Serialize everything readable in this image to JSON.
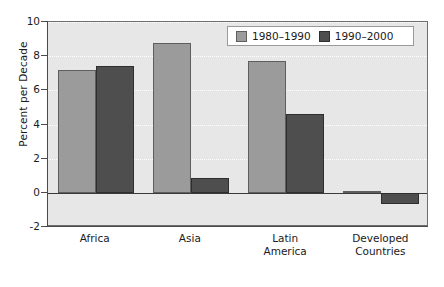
{
  "chart_data": {
    "type": "bar",
    "title": "",
    "xlabel": "",
    "ylabel": "Percent per Decade",
    "ylim": [
      -2,
      10
    ],
    "yticks": [
      -2,
      0,
      2,
      4,
      6,
      8,
      10
    ],
    "ytick_labels": [
      "-2",
      "0",
      "2",
      "4",
      "6",
      "8",
      "10"
    ],
    "grid": true,
    "legend_position": "top-right",
    "categories": [
      "Africa",
      "Asia",
      "Latin America",
      "Developed Countries"
    ],
    "category_lines": [
      [
        "Africa"
      ],
      [
        "Asia"
      ],
      [
        "Latin",
        "America"
      ],
      [
        "Developed",
        "Countries"
      ]
    ],
    "series": [
      {
        "name": "1980–1990",
        "color": "#9b9b9b",
        "values": [
          7.2,
          8.75,
          7.7,
          0.1
        ]
      },
      {
        "name": "1990–2000",
        "color": "#4e4e4e",
        "values": [
          7.45,
          0.85,
          4.6,
          -0.65
        ]
      }
    ]
  },
  "legend": {
    "entries": [
      {
        "label": "1980–1990",
        "swatch": "light"
      },
      {
        "label": "1990–2000",
        "swatch": "dark"
      }
    ]
  },
  "axis": {
    "y_title": "Percent per Decade"
  }
}
